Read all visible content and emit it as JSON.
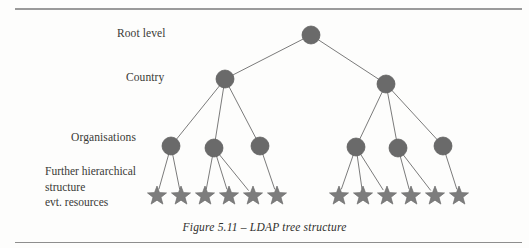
{
  "figure": {
    "caption": "Figure 5.11 – LDAP tree structure",
    "top_rule": "horizontal-rule",
    "bottom_rule": "horizontal-rule"
  },
  "levels": [
    {
      "id": "root",
      "label": "Root level"
    },
    {
      "id": "country",
      "label": "Country"
    },
    {
      "id": "organisations",
      "label": "Organisations"
    },
    {
      "id": "leaves",
      "label_lines": [
        "Further hierarchical",
        "structure",
        "evt. resources"
      ]
    }
  ],
  "labels": {
    "root_level": "Root level",
    "country": "Country",
    "organisations": "Organisations",
    "leaf_line_1": "Further hierarchical",
    "leaf_line_2": "structure",
    "leaf_line_3": "evt. resources"
  },
  "colors": {
    "node_fill": "#6a6a6a",
    "node_stroke": "#5a5a5a",
    "star_fill": "#7d7d7d",
    "star_stroke": "#6d6d6d",
    "edge": "#7b7b7b",
    "rule": "#9a9a9a",
    "text": "#3a3a36",
    "background": "#fdfdfc"
  },
  "graph": {
    "type": "tree",
    "node_radius": 9,
    "star_radius": 10,
    "nodes": [
      {
        "id": "root",
        "level": "root",
        "cx": 311,
        "cy": 35,
        "shape": "circle"
      },
      {
        "id": "c1",
        "level": "country",
        "cx": 225,
        "cy": 79,
        "shape": "circle"
      },
      {
        "id": "c2",
        "level": "country",
        "cx": 386,
        "cy": 84,
        "shape": "circle"
      },
      {
        "id": "o1",
        "level": "organisations",
        "cx": 171,
        "cy": 146,
        "shape": "circle"
      },
      {
        "id": "o2",
        "level": "organisations",
        "cx": 214,
        "cy": 148,
        "shape": "circle"
      },
      {
        "id": "o3",
        "level": "organisations",
        "cx": 260,
        "cy": 146,
        "shape": "circle"
      },
      {
        "id": "o4",
        "level": "organisations",
        "cx": 356,
        "cy": 147,
        "shape": "circle"
      },
      {
        "id": "o5",
        "level": "organisations",
        "cx": 398,
        "cy": 148,
        "shape": "circle"
      },
      {
        "id": "o6",
        "level": "organisations",
        "cx": 443,
        "cy": 146,
        "shape": "circle"
      },
      {
        "id": "s1",
        "level": "leaves",
        "cx": 157,
        "cy": 196,
        "shape": "star"
      },
      {
        "id": "s2",
        "level": "leaves",
        "cx": 181,
        "cy": 196,
        "shape": "star"
      },
      {
        "id": "s3",
        "level": "leaves",
        "cx": 205,
        "cy": 196,
        "shape": "star"
      },
      {
        "id": "s4",
        "level": "leaves",
        "cx": 229,
        "cy": 196,
        "shape": "star"
      },
      {
        "id": "s5",
        "level": "leaves",
        "cx": 253,
        "cy": 196,
        "shape": "star"
      },
      {
        "id": "s6",
        "level": "leaves",
        "cx": 277,
        "cy": 196,
        "shape": "star"
      },
      {
        "id": "s7",
        "level": "leaves",
        "cx": 339,
        "cy": 196,
        "shape": "star"
      },
      {
        "id": "s8",
        "level": "leaves",
        "cx": 363,
        "cy": 196,
        "shape": "star"
      },
      {
        "id": "s9",
        "level": "leaves",
        "cx": 387,
        "cy": 196,
        "shape": "star"
      },
      {
        "id": "s10",
        "level": "leaves",
        "cx": 411,
        "cy": 196,
        "shape": "star"
      },
      {
        "id": "s11",
        "level": "leaves",
        "cx": 435,
        "cy": 196,
        "shape": "star"
      },
      {
        "id": "s12",
        "level": "leaves",
        "cx": 459,
        "cy": 196,
        "shape": "star"
      }
    ],
    "edges": [
      {
        "from": "root",
        "to": "c1"
      },
      {
        "from": "root",
        "to": "c2"
      },
      {
        "from": "c1",
        "to": "o1"
      },
      {
        "from": "c1",
        "to": "o2"
      },
      {
        "from": "c1",
        "to": "o3"
      },
      {
        "from": "c2",
        "to": "o4"
      },
      {
        "from": "c2",
        "to": "o5"
      },
      {
        "from": "c2",
        "to": "o6"
      },
      {
        "from": "o1",
        "to": "s1"
      },
      {
        "from": "o1",
        "to": "s2"
      },
      {
        "from": "o2",
        "to": "s3"
      },
      {
        "from": "o2",
        "to": "s4"
      },
      {
        "from": "o2",
        "to": "s5"
      },
      {
        "from": "o3",
        "to": "s6"
      },
      {
        "from": "o4",
        "to": "s7"
      },
      {
        "from": "o4",
        "to": "s8"
      },
      {
        "from": "o4",
        "to": "s9"
      },
      {
        "from": "o5",
        "to": "s10"
      },
      {
        "from": "o5",
        "to": "s11"
      },
      {
        "from": "o6",
        "to": "s12"
      }
    ]
  }
}
